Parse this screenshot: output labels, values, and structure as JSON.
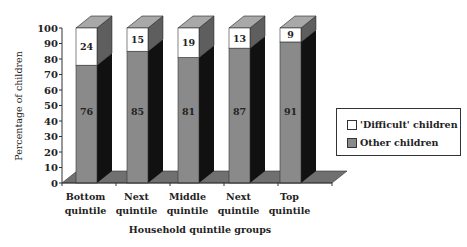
{
  "chart_data": {
    "type": "bar",
    "subtype": "stacked-3d-percent",
    "title": "",
    "xlabel": "Household quintile groups",
    "ylabel": "Percentage of children",
    "ylim": [
      0,
      100
    ],
    "yticks": [
      "0",
      "10",
      "20",
      "30",
      "40",
      "50",
      "60",
      "70",
      "80",
      "90",
      "100"
    ],
    "categories": [
      "Bottom quintile",
      "Next quintile",
      "Middle quintile",
      "Next quintile",
      "Top quintile"
    ],
    "category_lines": [
      [
        "Bottom",
        "quintile"
      ],
      [
        "Next",
        "quintile"
      ],
      [
        "Middle",
        "quintile"
      ],
      [
        "Next",
        "quintile"
      ],
      [
        "Top",
        "quintile"
      ]
    ],
    "series": [
      {
        "name": "Other children",
        "values": [
          76,
          85,
          81,
          87,
          91
        ],
        "color": "#8a8a8a"
      },
      {
        "name": "'Difficult' children",
        "values": [
          24,
          15,
          19,
          13,
          9
        ],
        "color": "#ffffff"
      }
    ],
    "legend_position": "right",
    "grid": false
  },
  "legend": {
    "items": [
      {
        "label": "'Difficult' children",
        "color": "#ffffff"
      },
      {
        "label": "Other children",
        "color": "#8a8a8a"
      }
    ]
  }
}
